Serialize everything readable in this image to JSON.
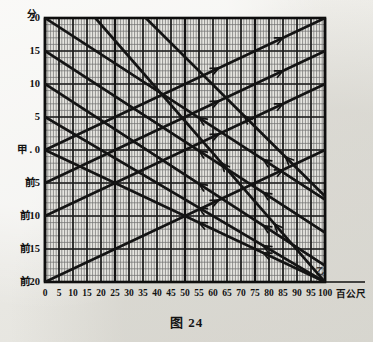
{
  "figure": {
    "caption": "图 24",
    "caption_number": "24",
    "type": "train-running-diagram"
  },
  "axes": {
    "y_axis_title": "分",
    "y_axis_unit_name": "minutes",
    "x_axis_unit": "百公尺",
    "origin_station_label": "甲",
    "far_station_label": "乙",
    "y_labels": [
      {
        "text": "20",
        "value": 20
      },
      {
        "text": "15",
        "value": 15
      },
      {
        "text": "10",
        "value": 10
      },
      {
        "text": "5",
        "value": 5
      },
      {
        "text": "甲 . 0",
        "value": 0
      },
      {
        "text": "前5",
        "value": -5
      },
      {
        "text": "前10",
        "value": -10
      },
      {
        "text": "前15",
        "value": -15
      },
      {
        "text": "前20",
        "value": -20
      }
    ],
    "x_labels": [
      "0",
      "5",
      "10",
      "15",
      "20",
      "25",
      "30",
      "35",
      "40",
      "45",
      "50",
      "55",
      "60",
      "65",
      "70",
      "75",
      "80",
      "85",
      "90",
      "95",
      "100"
    ],
    "x_label_values": [
      0,
      5,
      10,
      15,
      20,
      25,
      30,
      35,
      40,
      45,
      50,
      55,
      60,
      65,
      70,
      75,
      80,
      85,
      90,
      95,
      100
    ]
  },
  "chart_data": {
    "type": "line",
    "title": "图 24",
    "xlabel": "百公尺",
    "ylabel": "分",
    "xlim": [
      0,
      100
    ],
    "ylim": [
      -20,
      20
    ],
    "grid": true,
    "minor_grid_step_x": 1,
    "major_grid_step_x": 5,
    "minor_grid_step_y": 1,
    "major_grid_step_y": 5,
    "legend": "none",
    "annotations": [
      {
        "text": "甲",
        "x": 0,
        "y": 0
      },
      {
        "text": "乙",
        "x": 100,
        "y": -20
      }
    ],
    "series": [
      {
        "name": "down-1",
        "direction": "descending",
        "arrow": "up-left",
        "points": [
          [
            0,
            20
          ],
          [
            100,
            -7.5
          ]
        ]
      },
      {
        "name": "down-2",
        "direction": "descending",
        "arrow": "up-left",
        "points": [
          [
            0,
            15
          ],
          [
            100,
            -12.5
          ]
        ]
      },
      {
        "name": "down-3",
        "direction": "descending",
        "arrow": "up-left",
        "points": [
          [
            0,
            10
          ],
          [
            100,
            -17.5
          ]
        ]
      },
      {
        "name": "down-4",
        "direction": "descending",
        "arrow": "up-left",
        "points": [
          [
            0,
            5
          ],
          [
            100,
            -20
          ]
        ]
      },
      {
        "name": "down-5",
        "direction": "descending",
        "arrow": "up-left",
        "points": [
          [
            0,
            0
          ],
          [
            100,
            -20
          ]
        ]
      },
      {
        "name": "down-6",
        "direction": "descending",
        "arrow": "up-left",
        "points": [
          [
            18,
            20
          ],
          [
            100,
            -20
          ]
        ]
      },
      {
        "name": "down-7",
        "direction": "descending",
        "arrow": "up-left",
        "points": [
          [
            36,
            20
          ],
          [
            100,
            -7
          ]
        ]
      },
      {
        "name": "up-1",
        "direction": "ascending",
        "arrow": "up-right",
        "points": [
          [
            0,
            0
          ],
          [
            100,
            20
          ]
        ]
      },
      {
        "name": "up-2",
        "direction": "ascending",
        "arrow": "up-right",
        "points": [
          [
            0,
            -5
          ],
          [
            100,
            15
          ]
        ]
      },
      {
        "name": "up-3",
        "direction": "ascending",
        "arrow": "up-right",
        "points": [
          [
            0,
            -10
          ],
          [
            100,
            10
          ]
        ]
      },
      {
        "name": "up-4",
        "direction": "ascending",
        "arrow": "up-right",
        "points": [
          [
            0,
            -20
          ],
          [
            100,
            0
          ]
        ]
      }
    ]
  },
  "colors": {
    "ink": "#141414",
    "grid_minor": "#6e6e6e",
    "grid_major": "#1c1c1c",
    "paper": "#edece7"
  }
}
